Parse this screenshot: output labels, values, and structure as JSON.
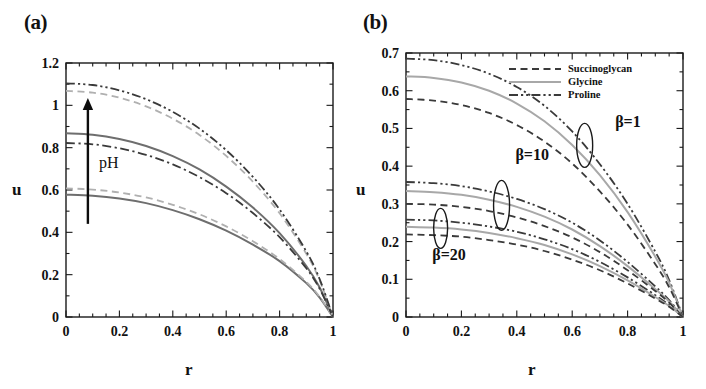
{
  "figure": {
    "panels": [
      {
        "id": "a",
        "label": "(a)",
        "xlabel": "r",
        "ylabel": "u",
        "xticks": [
          "0",
          "0.2",
          "0.4",
          "0.6",
          "0.8",
          "1"
        ],
        "yticks": [
          "0",
          "0.2",
          "0.4",
          "0.6",
          "0.8",
          "1",
          "1.2"
        ],
        "annotation": "pH"
      },
      {
        "id": "b",
        "label": "(b)",
        "xlabel": "r",
        "ylabel": "u",
        "xticks": [
          "0",
          "0.2",
          "0.4",
          "0.6",
          "0.8",
          "1"
        ],
        "yticks": [
          "0",
          "0.1",
          "0.2",
          "0.3",
          "0.4",
          "0.5",
          "0.6",
          "0.7"
        ],
        "annotations": [
          "β=1",
          "β=10",
          "β=20"
        ],
        "legend": [
          {
            "label": "Succinoglycan",
            "style": "dashed",
            "color": "#3a3a3a"
          },
          {
            "label": "Glycine",
            "style": "solid",
            "color": "#a8a8a8"
          },
          {
            "label": "Proline",
            "style": "dash-dot-dot",
            "color": "#3a3a3a"
          }
        ]
      }
    ]
  },
  "chart_data": [
    {
      "type": "line",
      "panel": "a",
      "title": "(a)",
      "xlabel": "r",
      "ylabel": "u",
      "xlim": [
        0,
        1
      ],
      "ylim": [
        0,
        1.2
      ],
      "xticks": [
        0,
        0.2,
        0.4,
        0.6,
        0.8,
        1
      ],
      "yticks": [
        0,
        0.2,
        0.4,
        0.6,
        0.8,
        1,
        1.2
      ],
      "grid": false,
      "legend_position": "none",
      "annotations": [
        {
          "text": "pH",
          "x": 0.12,
          "y": 0.72,
          "arrow": {
            "from": [
              0.08,
              0.45
            ],
            "to": [
              0.08,
              1.03
            ]
          }
        }
      ],
      "x": [
        0,
        0.1,
        0.2,
        0.3,
        0.4,
        0.5,
        0.6,
        0.7,
        0.8,
        0.9,
        0.95,
        1
      ],
      "series": [
        {
          "name": "pH-low-solid",
          "style": "solid",
          "color": "#6e6e6e",
          "values": [
            0.578,
            0.573,
            0.56,
            0.538,
            0.505,
            0.462,
            0.408,
            0.342,
            0.264,
            0.16,
            0.092,
            0.0
          ]
        },
        {
          "name": "pH-low-dashed",
          "style": "dashed",
          "color": "#b0b0b0",
          "values": [
            0.608,
            0.602,
            0.588,
            0.565,
            0.53,
            0.485,
            0.428,
            0.358,
            0.274,
            0.166,
            0.095,
            0.0
          ]
        },
        {
          "name": "pH-mid-solid",
          "style": "solid",
          "color": "#6e6e6e",
          "values": [
            0.868,
            0.861,
            0.841,
            0.808,
            0.76,
            0.697,
            0.616,
            0.517,
            0.396,
            0.241,
            0.139,
            0.0
          ]
        },
        {
          "name": "pH-mid-dashdot",
          "style": "dash-dot",
          "color": "#3a3a3a",
          "values": [
            0.822,
            0.816,
            0.797,
            0.766,
            0.721,
            0.661,
            0.585,
            0.491,
            0.377,
            0.23,
            0.133,
            0.0
          ]
        },
        {
          "name": "pH-high-dashed",
          "style": "dashed",
          "color": "#b0b0b0",
          "values": [
            1.068,
            1.06,
            1.036,
            0.995,
            0.937,
            0.86,
            0.761,
            0.639,
            0.49,
            0.299,
            0.173,
            0.0
          ]
        },
        {
          "name": "pH-high-dashdotdot",
          "style": "dash-dot-dot",
          "color": "#3a3a3a",
          "values": [
            1.104,
            1.096,
            1.071,
            1.029,
            0.969,
            0.89,
            0.788,
            0.662,
            0.508,
            0.31,
            0.179,
            0.0
          ]
        }
      ]
    },
    {
      "type": "line",
      "panel": "b",
      "title": "(b)",
      "xlabel": "r",
      "ylabel": "u",
      "xlim": [
        0,
        1
      ],
      "ylim": [
        0,
        0.7
      ],
      "xticks": [
        0,
        0.2,
        0.4,
        0.6,
        0.8,
        1
      ],
      "yticks": [
        0,
        0.1,
        0.2,
        0.3,
        0.4,
        0.5,
        0.6,
        0.7
      ],
      "grid": false,
      "legend_position": "upper-right",
      "annotations": [
        {
          "text": "β=1",
          "x": 0.74,
          "y": 0.5
        },
        {
          "text": "β=10",
          "x": 0.41,
          "y": 0.41
        },
        {
          "text": "β=20",
          "x": 0.15,
          "y": 0.155
        }
      ],
      "groups": [
        {
          "name": "β=1",
          "x": [
            0,
            0.1,
            0.2,
            0.3,
            0.4,
            0.5,
            0.6,
            0.7,
            0.8,
            0.9,
            0.95,
            1
          ],
          "series": [
            {
              "name": "Proline",
              "style": "dash-dot-dot",
              "color": "#3a3a3a",
              "values": [
                0.685,
                0.681,
                0.668,
                0.645,
                0.61,
                0.56,
                0.492,
                0.405,
                0.3,
                0.173,
                0.098,
                0.0
              ]
            },
            {
              "name": "Glycine",
              "style": "solid",
              "color": "#a8a8a8",
              "values": [
                0.638,
                0.634,
                0.622,
                0.6,
                0.566,
                0.519,
                0.456,
                0.376,
                0.278,
                0.16,
                0.091,
                0.0
              ]
            },
            {
              "name": "Succinoglycan",
              "style": "dashed",
              "color": "#3a3a3a",
              "values": [
                0.578,
                0.574,
                0.562,
                0.541,
                0.509,
                0.465,
                0.407,
                0.333,
                0.245,
                0.14,
                0.079,
                0.0
              ]
            }
          ]
        },
        {
          "name": "β=10",
          "x": [
            0,
            0.1,
            0.2,
            0.3,
            0.4,
            0.5,
            0.6,
            0.7,
            0.8,
            0.9,
            0.95,
            1
          ],
          "series": [
            {
              "name": "Proline",
              "style": "dash-dot-dot",
              "color": "#3a3a3a",
              "values": [
                0.358,
                0.355,
                0.347,
                0.333,
                0.313,
                0.286,
                0.25,
                0.203,
                0.146,
                0.081,
                0.045,
                0.0
              ]
            },
            {
              "name": "Glycine",
              "style": "solid",
              "color": "#a8a8a8",
              "values": [
                0.334,
                0.331,
                0.324,
                0.311,
                0.292,
                0.266,
                0.232,
                0.188,
                0.135,
                0.074,
                0.041,
                0.0
              ]
            },
            {
              "name": "Succinoglycan",
              "style": "dashed",
              "color": "#3a3a3a",
              "values": [
                0.3,
                0.298,
                0.292,
                0.281,
                0.264,
                0.241,
                0.211,
                0.172,
                0.124,
                0.069,
                0.038,
                0.0
              ]
            }
          ]
        },
        {
          "name": "β=20",
          "x": [
            0,
            0.1,
            0.2,
            0.3,
            0.4,
            0.5,
            0.6,
            0.7,
            0.8,
            0.9,
            0.95,
            1
          ],
          "series": [
            {
              "name": "Proline",
              "style": "dash-dot-dot",
              "color": "#3a3a3a",
              "values": [
                0.258,
                0.256,
                0.25,
                0.24,
                0.226,
                0.206,
                0.18,
                0.146,
                0.105,
                0.058,
                0.032,
                0.0
              ]
            },
            {
              "name": "Glycine",
              "style": "solid",
              "color": "#a8a8a8",
              "values": [
                0.239,
                0.237,
                0.232,
                0.223,
                0.209,
                0.191,
                0.166,
                0.135,
                0.097,
                0.053,
                0.029,
                0.0
              ]
            },
            {
              "name": "Succinoglycan",
              "style": "dashed",
              "color": "#3a3a3a",
              "values": [
                0.219,
                0.217,
                0.213,
                0.204,
                0.192,
                0.175,
                0.152,
                0.124,
                0.089,
                0.049,
                0.027,
                0.0
              ]
            }
          ]
        }
      ]
    }
  ]
}
